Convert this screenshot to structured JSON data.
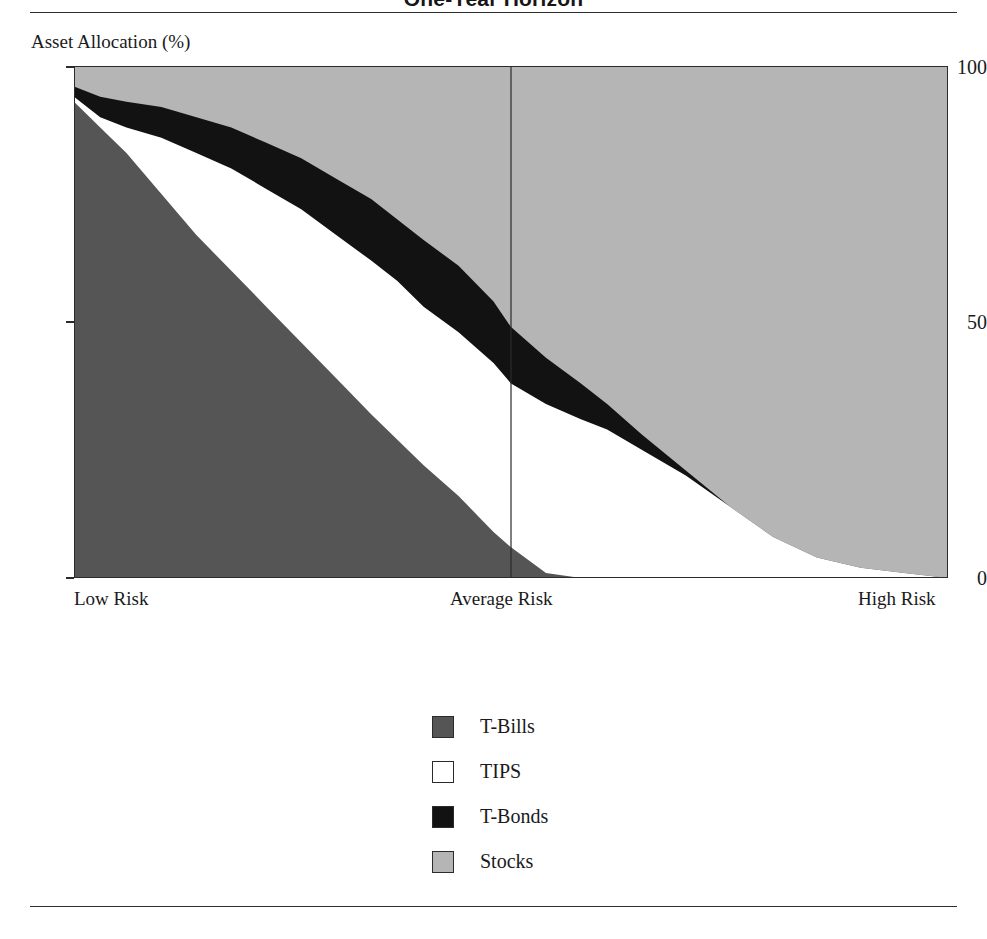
{
  "figure": {
    "title": "One-Year Horizon"
  },
  "axes": {
    "y_caption": "Asset Allocation (%)",
    "y_ticks": [
      "100",
      "50",
      "0"
    ],
    "x_ticks": [
      "Low Risk",
      "Average Risk",
      "High Risk"
    ]
  },
  "legend": {
    "items": [
      {
        "label": "T-Bills",
        "color": "#555555"
      },
      {
        "label": "TIPS",
        "color": "#ffffff"
      },
      {
        "label": "T-Bonds",
        "color": "#121212"
      },
      {
        "label": "Stocks",
        "color": "#b5b5b5"
      }
    ]
  },
  "colors": {
    "t_bills": "#555555",
    "tips": "#ffffff",
    "t_bonds": "#121212",
    "stocks": "#b5b5b5",
    "frame": "#2b2b2b",
    "rule": "#2e2e2e"
  },
  "chart_data": {
    "type": "area",
    "title": "One-Year Horizon",
    "xlabel": "",
    "ylabel": "Asset Allocation (%)",
    "ylim": [
      0,
      100
    ],
    "xlim": [
      0,
      100
    ],
    "stacked": true,
    "grid": false,
    "legend_position": "below-center",
    "x_tick_labels": [
      "Low Risk",
      "Average Risk",
      "High Risk"
    ],
    "x_tick_positions": [
      0,
      50,
      100
    ],
    "y_tick_values": [
      0,
      50,
      100
    ],
    "annotations": [
      {
        "type": "vertical-line",
        "x": 50,
        "label": "Average Risk"
      }
    ],
    "x": [
      0,
      3,
      6,
      10,
      14,
      18,
      22,
      26,
      30,
      34,
      37,
      40,
      44,
      48,
      50,
      54,
      58,
      61,
      65,
      70,
      75,
      80,
      85,
      90,
      95,
      100
    ],
    "series": [
      {
        "name": "T-Bills",
        "color": "#555555",
        "values": [
          93,
          88,
          83,
          75,
          67,
          60,
          53,
          46,
          39,
          32,
          27,
          22,
          16,
          9,
          6,
          1,
          0,
          0,
          0,
          0,
          0,
          0,
          0,
          0,
          0,
          0
        ]
      },
      {
        "name": "TIPS",
        "color": "#ffffff",
        "values": [
          1,
          2,
          5,
          11,
          16,
          20,
          23,
          26,
          28,
          30,
          31,
          31,
          32,
          33,
          32,
          33,
          31,
          29,
          25,
          20,
          14,
          8,
          4,
          2,
          1,
          0
        ]
      },
      {
        "name": "T-Bonds",
        "color": "#121212",
        "values": [
          2,
          4,
          5,
          6,
          7,
          8,
          9,
          10,
          11,
          12,
          12,
          13,
          13,
          12,
          11,
          9,
          7,
          5,
          3,
          1,
          0,
          0,
          0,
          0,
          0,
          0
        ]
      },
      {
        "name": "Stocks",
        "color": "#b5b5b5",
        "values": [
          4,
          6,
          7,
          8,
          10,
          12,
          15,
          18,
          22,
          26,
          30,
          34,
          39,
          46,
          51,
          57,
          62,
          66,
          72,
          79,
          86,
          92,
          96,
          98,
          99,
          100
        ]
      }
    ]
  }
}
